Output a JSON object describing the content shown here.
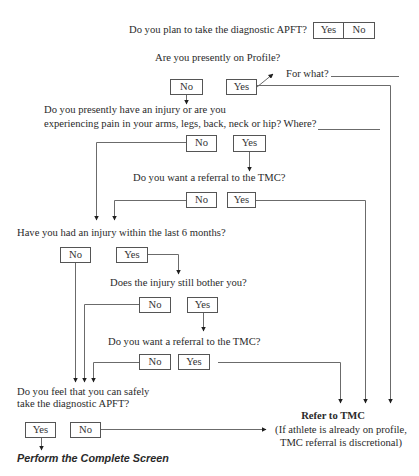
{
  "flowchart": {
    "q1": {
      "text": "Do you plan to take the diagnostic APFT?",
      "yes": "Yes",
      "no": "No"
    },
    "q2": {
      "text": "Are you presently on Profile?",
      "no": "No",
      "yes": "Yes",
      "followup": "For what?"
    },
    "q3": {
      "line1": "Do you presently have an injury or are you",
      "line2": "experiencing pain in your arms, legs, back, neck or hip? Where?",
      "no": "No",
      "yes": "Yes"
    },
    "q4": {
      "text": "Do you want a referral to the TMC?",
      "no": "No",
      "yes": "Yes"
    },
    "q5": {
      "text": "Have you had an injury within the last 6 months?",
      "no": "No",
      "yes": "Yes"
    },
    "q6": {
      "text": "Does the injury still bother you?",
      "no": "No",
      "yes": "Yes"
    },
    "q7": {
      "text": "Do you want a referral to the TMC?",
      "no": "No",
      "yes": "Yes"
    },
    "q8": {
      "line1": "Do you feel that you can safely",
      "line2": "take the diagnostic APFT?",
      "yes": "Yes",
      "no": "No"
    },
    "outcome_screen": "Perform the Complete Screen",
    "outcome_refer": {
      "title": "Refer to TMC",
      "note1": "(If athlete is already on profile,",
      "note2": "TMC referral is discretional)"
    },
    "colors": {
      "line": "#6b6b6b",
      "arrow": "#1e1e1e",
      "text": "#2a2a2a"
    }
  }
}
